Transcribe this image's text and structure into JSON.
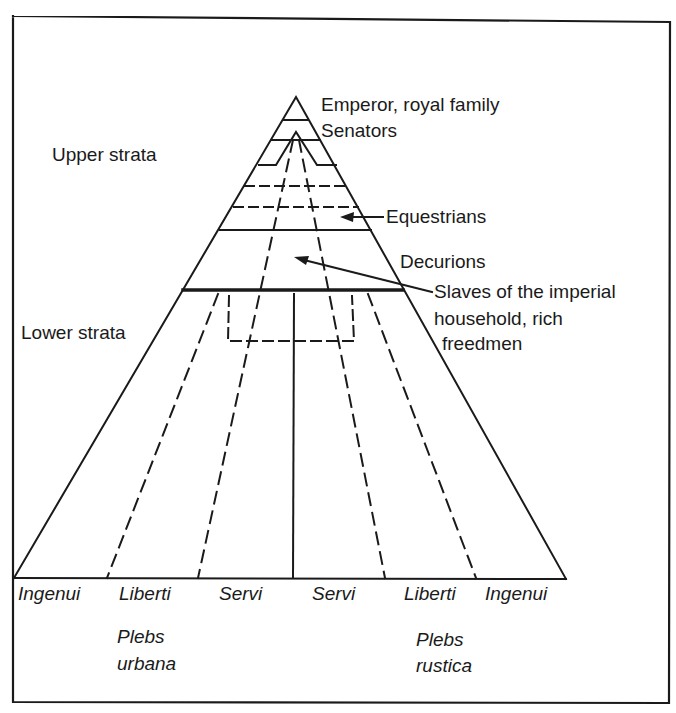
{
  "diagram": {
    "apex_labels": {
      "emperor": "Emperor, royal family",
      "senators": "Senators",
      "equestrians": "Equestrians",
      "decurions": "Decurions",
      "slaves_line1": "Slaves of the imperial",
      "slaves_line2": "household, rich",
      "slaves_line3": "freedmen"
    },
    "strata": {
      "upper": "Upper strata",
      "lower": "Lower strata"
    },
    "base_columns": [
      {
        "label": "Ingenui"
      },
      {
        "label": "Liberti"
      },
      {
        "label": "Servi"
      },
      {
        "label": "Servi"
      },
      {
        "label": "Liberti"
      },
      {
        "label": "Ingenui"
      }
    ],
    "groups": {
      "urbana_line1": "Plebs",
      "urbana_line2": "urbana",
      "rustica_line1": "Plebs",
      "rustica_line2": "rustica"
    },
    "colors": {
      "ink": "#1a1a1a",
      "background": "#ffffff"
    }
  }
}
